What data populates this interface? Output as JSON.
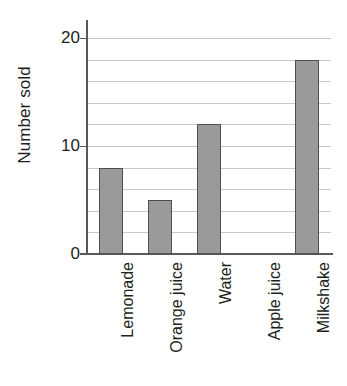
{
  "chart_data": {
    "type": "bar",
    "title": "",
    "subtitle": "",
    "xlabel": "",
    "ylabel": "Number sold",
    "categories": [
      "Lemonade",
      "Orange juice",
      "Water",
      "Apple juice",
      "Milkshake"
    ],
    "values": [
      8,
      5,
      12,
      0,
      18
    ],
    "ylim": [
      0,
      20
    ],
    "y_tick_labels": [
      "0",
      "10",
      "20"
    ],
    "y_tick_values": [
      0,
      10,
      20
    ],
    "gridline_values": [
      2,
      4,
      6,
      8,
      10,
      12,
      14,
      16,
      18,
      20
    ],
    "grid": true,
    "legend": false,
    "legend_position": "none",
    "bar_fill_color": "#9a9a9a",
    "bar_border_color": "#4f4f4f",
    "axis_color": "#58595b",
    "gridline_color": "#c9c9c9"
  }
}
